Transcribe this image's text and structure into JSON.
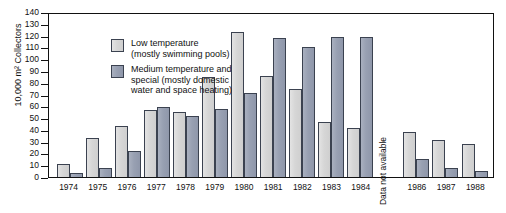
{
  "chart_data": {
    "type": "bar",
    "title": "",
    "xlabel": "",
    "ylabel": "10,000 m² Collectors",
    "ylim": [
      0,
      140
    ],
    "ytick_step": 10,
    "yticks": [
      140,
      130,
      120,
      110,
      100,
      90,
      80,
      70,
      60,
      50,
      40,
      30,
      20,
      10,
      0
    ],
    "grid": false,
    "legend_position": "top-left",
    "categories": [
      "1974",
      "1975",
      "1976",
      "1977",
      "1978",
      "1979",
      "1980",
      "1981",
      "1982",
      "1983",
      "1984",
      "1985",
      "1986",
      "1987",
      "1988"
    ],
    "series": [
      {
        "name": "Low temperature (mostly swimming pools)",
        "color": "#d6d6d6",
        "values": [
          11,
          33,
          43,
          57,
          55,
          85,
          123,
          86,
          75,
          47,
          42,
          null,
          38,
          31,
          28
        ]
      },
      {
        "name": "Medium temperature and special (mostly domestic water and space heating)",
        "color": "#98a0b2",
        "values": [
          3,
          8,
          22,
          59,
          52,
          58,
          71,
          118,
          110,
          119,
          119,
          null,
          15,
          8,
          5
        ]
      }
    ],
    "annotations": [
      {
        "category": "1985",
        "text": "Data not available",
        "rotation": -90
      }
    ]
  },
  "legend": {
    "items": [
      {
        "swatch": "low",
        "label": "Low temperature\n(mostly swimming pools)"
      },
      {
        "swatch": "med",
        "label": "Medium temperature and\nspecial (mostly domestic\nwater and space heating)"
      }
    ]
  },
  "colors": {
    "low_temperature": "#d6d6d6",
    "medium_temperature": "#98a0b2",
    "axis": "#111111",
    "bar_outline": "#3b4250",
    "background": "#ffffff"
  }
}
